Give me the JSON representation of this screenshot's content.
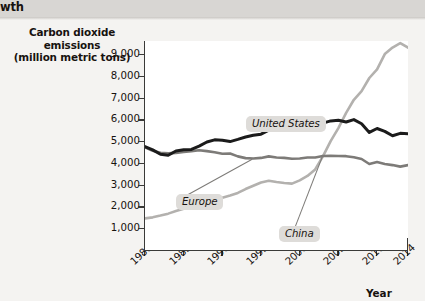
{
  "header": {
    "partial_title": "wth",
    "band_color": "#d8d6d3"
  },
  "chart_data": {
    "type": "line",
    "title": "",
    "xlabel": "Year",
    "ylabel": "Carbon dioxide emissions\n(million metric tons)",
    "ylabel_line1": "Carbon dioxide emissions",
    "ylabel_line2": "(million metric tons)",
    "grid": false,
    "legend_position": "inline-callout",
    "xlim": [
      1980,
      2014
    ],
    "ylim": [
      0,
      9600
    ],
    "ytick_labels": [
      "9,000",
      "8,000",
      "7,000",
      "6,000",
      "5,000",
      "4,000",
      "3,000",
      "2,000",
      "1,000"
    ],
    "ytick_values": [
      9000,
      8000,
      7000,
      6000,
      5000,
      4000,
      3000,
      2000,
      1000
    ],
    "xtick_labels": [
      "1980",
      "1985",
      "1990",
      "1995",
      "2000",
      "2005",
      "2010",
      "2014"
    ],
    "xtick_values": [
      1980,
      1985,
      1990,
      1995,
      2000,
      2005,
      2010,
      2014
    ],
    "x": [
      1980,
      1981,
      1982,
      1983,
      1984,
      1985,
      1986,
      1987,
      1988,
      1989,
      1990,
      1991,
      1992,
      1993,
      1994,
      1995,
      1996,
      1997,
      1998,
      1999,
      2000,
      2001,
      2002,
      2003,
      2004,
      2005,
      2006,
      2007,
      2008,
      2009,
      2010,
      2011,
      2012,
      2013,
      2014
    ],
    "series": [
      {
        "name": "United States",
        "color": "#1b1b1b",
        "width": 3.0,
        "values": [
          4750,
          4600,
          4400,
          4350,
          4550,
          4600,
          4620,
          4770,
          4960,
          5060,
          5040,
          4980,
          5080,
          5190,
          5270,
          5320,
          5500,
          5570,
          5590,
          5680,
          5860,
          5750,
          5800,
          5830,
          5930,
          5960,
          5880,
          5990,
          5800,
          5400,
          5580,
          5450,
          5250,
          5360,
          5340
        ]
      },
      {
        "name": "Europe",
        "color": "#7d7b78",
        "width": 2.6,
        "values": [
          4720,
          4560,
          4470,
          4440,
          4460,
          4500,
          4540,
          4580,
          4540,
          4490,
          4420,
          4430,
          4300,
          4220,
          4200,
          4230,
          4300,
          4250,
          4230,
          4190,
          4200,
          4250,
          4250,
          4320,
          4330,
          4320,
          4310,
          4260,
          4180,
          3950,
          4040,
          3950,
          3900,
          3830,
          3900
        ]
      },
      {
        "name": "China",
        "color": "#b3b1ae",
        "width": 2.6,
        "values": [
          1450,
          1500,
          1580,
          1670,
          1790,
          1900,
          2000,
          2130,
          2280,
          2360,
          2400,
          2500,
          2620,
          2800,
          2950,
          3100,
          3180,
          3120,
          3080,
          3050,
          3200,
          3400,
          3700,
          4300,
          5000,
          5600,
          6300,
          6900,
          7300,
          7900,
          8300,
          9000,
          9300,
          9500,
          9300
        ]
      }
    ],
    "annotations": [
      {
        "label": "United States",
        "target_year": 2000,
        "target_value": 5860
      },
      {
        "label": "Europe",
        "target_year": 1994,
        "target_value": 4200
      },
      {
        "label": "China",
        "target_year": 2003,
        "target_value": 4300
      }
    ]
  }
}
